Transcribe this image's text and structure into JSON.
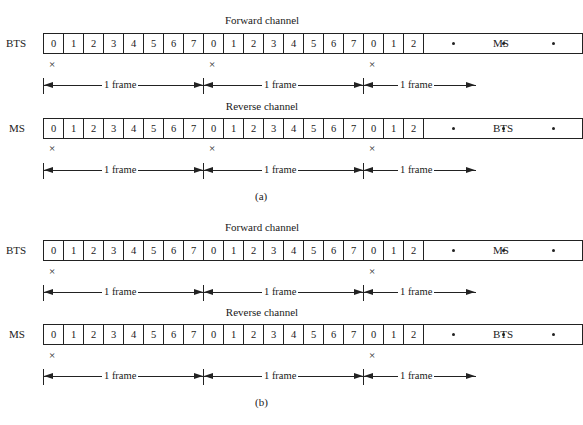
{
  "diagram": {
    "panels": [
      {
        "caption": "(a)",
        "channels": [
          {
            "title": "Forward channel",
            "left_label": "BTS",
            "right_label": "MS",
            "slots": [
              "0",
              "1",
              "2",
              "3",
              "4",
              "5",
              "6",
              "7",
              "0",
              "1",
              "2",
              "3",
              "4",
              "5",
              "6",
              "7",
              "0",
              "1",
              "2"
            ],
            "continuation": "• • •",
            "x_marks_under_frames": [
              1,
              2,
              3
            ],
            "frame_labels": [
              "1 frame",
              "1 frame",
              "1 frame"
            ]
          },
          {
            "title": "Reverse channel",
            "left_label": "MS",
            "right_label": "BTS",
            "slots": [
              "0",
              "1",
              "2",
              "3",
              "4",
              "5",
              "6",
              "7",
              "0",
              "1",
              "2",
              "3",
              "4",
              "5",
              "6",
              "7",
              "0",
              "1",
              "2"
            ],
            "continuation": "• • •",
            "x_marks_under_frames": [
              1,
              2,
              3
            ],
            "frame_labels": [
              "1 frame",
              "1 frame",
              "1 frame"
            ]
          }
        ]
      },
      {
        "caption": "(b)",
        "channels": [
          {
            "title": "Forward channel",
            "left_label": "BTS",
            "right_label": "MS",
            "slots": [
              "0",
              "1",
              "2",
              "3",
              "4",
              "5",
              "6",
              "7",
              "0",
              "1",
              "2",
              "3",
              "4",
              "5",
              "6",
              "7",
              "0",
              "1",
              "2"
            ],
            "continuation": "• • •",
            "x_marks_under_frames": [
              1,
              3
            ],
            "frame_labels": [
              "1 frame",
              "1 frame",
              "1 frame"
            ]
          },
          {
            "title": "Reverse channel",
            "left_label": "MS",
            "right_label": "BTS",
            "slots": [
              "0",
              "1",
              "2",
              "3",
              "4",
              "5",
              "6",
              "7",
              "0",
              "1",
              "2",
              "3",
              "4",
              "5",
              "6",
              "7",
              "0",
              "1",
              "2"
            ],
            "continuation": "• • •",
            "x_marks_under_frames": [
              1,
              3
            ],
            "frame_labels": [
              "1 frame",
              "1 frame",
              "1 frame"
            ]
          }
        ]
      }
    ],
    "x_mark_glyph": "×"
  }
}
